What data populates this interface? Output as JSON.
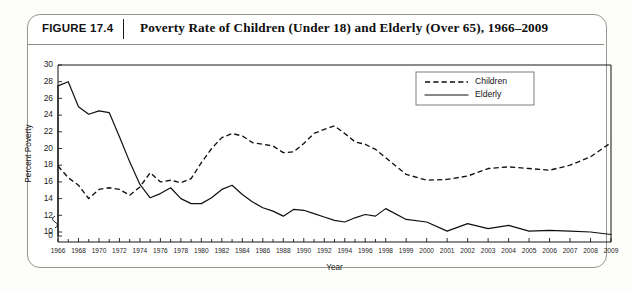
{
  "figure": {
    "label": "FIGURE 17.4",
    "divider": "|",
    "title": "Poverty Rate of Children (Under 18) and Elderly (Over 65), 1966–2009"
  },
  "chart_data": {
    "type": "line",
    "title": "Poverty Rate of Children (Under 18) and Elderly (Over 65), 1966–2009",
    "xlabel": "Year",
    "ylabel": "Percent Poverty",
    "ylim": [
      0,
      30
    ],
    "y_ticks": [
      0,
      10,
      12,
      14,
      16,
      18,
      20,
      22,
      24,
      26,
      28,
      30
    ],
    "y_axis_break": true,
    "y_axis_break_between": [
      0,
      10
    ],
    "grid": false,
    "legend_position": "top-right",
    "x_tick_labels": [
      "1966",
      "1968",
      "1970",
      "1972",
      "1974",
      "1976",
      "1978",
      "1980",
      "1982",
      "1984",
      "1986",
      "1988",
      "1990",
      "1992",
      "1994",
      "1996",
      "1998",
      "1999",
      "2000",
      "2001",
      "2002",
      "2003",
      "2004",
      "2005",
      "2006",
      "2007",
      "2008",
      "2009"
    ],
    "x": [
      1966,
      1967,
      1968,
      1969,
      1970,
      1971,
      1972,
      1973,
      1974,
      1975,
      1976,
      1977,
      1978,
      1979,
      1980,
      1981,
      1982,
      1983,
      1984,
      1985,
      1986,
      1987,
      1988,
      1989,
      1990,
      1991,
      1992,
      1993,
      1994,
      1995,
      1996,
      1997,
      1998,
      1999,
      2000,
      2001,
      2002,
      2003,
      2004,
      2005,
      2006,
      2007,
      2008,
      2009
    ],
    "series": [
      {
        "name": "Children",
        "style": "dashed",
        "color": "#101010",
        "values": [
          17.9,
          16.5,
          15.6,
          14.0,
          15.1,
          15.3,
          15.1,
          14.4,
          15.4,
          17.1,
          16.0,
          16.2,
          15.9,
          16.4,
          18.3,
          20.0,
          21.3,
          21.8,
          21.5,
          20.7,
          20.5,
          20.3,
          19.5,
          19.6,
          20.6,
          21.8,
          22.3,
          22.7,
          21.8,
          20.8,
          20.5,
          19.9,
          18.9,
          16.9,
          16.2,
          16.3,
          16.7,
          17.6,
          17.8,
          17.6,
          17.4,
          18.0,
          19.0,
          20.7
        ]
      },
      {
        "name": "Elderly",
        "style": "solid",
        "color": "#101010",
        "values": [
          27.5,
          28.0,
          25.0,
          24.1,
          24.5,
          24.3,
          21.4,
          18.4,
          15.7,
          14.1,
          14.6,
          15.3,
          14.0,
          13.4,
          13.4,
          14.1,
          15.1,
          15.6,
          14.5,
          13.6,
          12.9,
          12.5,
          11.9,
          12.7,
          12.6,
          12.2,
          11.8,
          11.4,
          11.2,
          11.7,
          12.1,
          11.9,
          12.8,
          11.5,
          11.2,
          10.1,
          11.0,
          10.4,
          10.8,
          10.1,
          10.2,
          10.1,
          10.0,
          9.7
        ]
      }
    ]
  }
}
